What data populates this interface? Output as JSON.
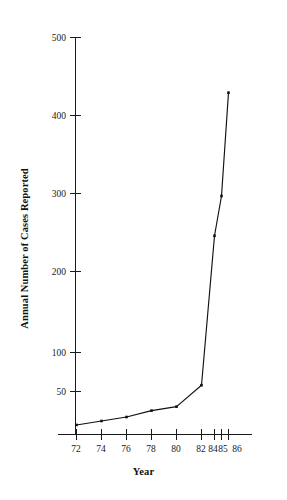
{
  "chart_data": {
    "type": "line",
    "title": "",
    "xlabel": "Year",
    "ylabel": "Annual Number of Cases Reported",
    "x": [
      72,
      74,
      76,
      78,
      80,
      82,
      84,
      85,
      86
    ],
    "values": [
      12,
      17,
      22,
      30,
      35,
      62,
      250,
      300,
      430
    ],
    "series": [
      {
        "name": "Annual Number of Cases Reported",
        "values": [
          12,
          17,
          22,
          30,
          35,
          62,
          250,
          300,
          430
        ]
      }
    ],
    "xtick_labels": [
      "72",
      "74",
      "76",
      "78",
      "80",
      "82",
      "84",
      "85",
      "86"
    ],
    "ytick_labels": [
      "50",
      "100",
      "200",
      "300",
      "400",
      "500"
    ],
    "ytick_values": [
      50,
      100,
      200,
      300,
      400,
      500
    ],
    "xlim": [
      70.5,
      87.5
    ],
    "ylim": [
      0,
      500
    ],
    "grid": false,
    "legend": false,
    "marker": "dot",
    "line_color": "#111111"
  },
  "axis_titles": {
    "y": "Annual Number of Cases Reported",
    "x": "Year"
  }
}
